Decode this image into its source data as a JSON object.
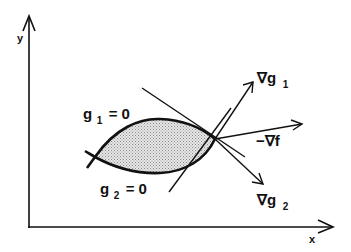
{
  "diagram": {
    "axes": {
      "x_label": "x",
      "y_label": "y"
    },
    "constraints": {
      "g1": {
        "name": "g",
        "subscript": "1",
        "equation": "= 0"
      },
      "g2": {
        "name": "g",
        "subscript": "2",
        "equation": "= 0"
      }
    },
    "vectors": {
      "grad_g1": {
        "symbol": "∇g",
        "subscript": "1"
      },
      "neg_grad_f": {
        "symbol": "−∇f",
        "subscript": ""
      },
      "grad_g2": {
        "symbol": "∇g",
        "subscript": "2"
      }
    },
    "colors": {
      "stroke": "#111111",
      "feasible_fill": "#c8c8c8",
      "background": "#ffffff"
    }
  }
}
